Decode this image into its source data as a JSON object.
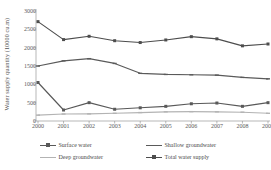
{
  "chart_data": {
    "type": "line",
    "title": "",
    "xlabel": "",
    "ylabel": "Water supply quantity (10000 cu.m)",
    "categories": [
      "2000",
      "2001",
      "2002",
      "2003",
      "2004",
      "2005",
      "2006",
      "2007",
      "2008",
      "2009"
    ],
    "ylim": [
      0,
      3000
    ],
    "yticks": [
      3000,
      2500,
      2000,
      1500,
      1000,
      500,
      0
    ],
    "ytick_labels": [
      "3000",
      "2500",
      "2000",
      "1500",
      "1000",
      "500",
      "0"
    ],
    "grid": false,
    "legend_position": "bottom",
    "series": [
      {
        "name": "Surface water",
        "color": "#595959",
        "marker": "square",
        "values": [
          1050,
          300,
          500,
          320,
          360,
          400,
          470,
          490,
          400,
          500
        ]
      },
      {
        "name": "Shallow groundwater",
        "color": "#5a5a5a",
        "marker": "dash",
        "values": [
          1500,
          1640,
          1700,
          1570,
          1300,
          1270,
          1260,
          1250,
          1190,
          1150
        ]
      },
      {
        "name": "Deep groundwater",
        "color": "#b3b3b3",
        "marker": "dash",
        "values": [
          160,
          190,
          195,
          210,
          230,
          250,
          255,
          250,
          240,
          210
        ]
      },
      {
        "name": "Total water supply",
        "color": "#4d4d4d",
        "marker": "square",
        "values": [
          2710,
          2220,
          2310,
          2190,
          2140,
          2210,
          2300,
          2240,
          2050,
          2100
        ]
      }
    ]
  },
  "legend": {
    "items": [
      {
        "label": "Surface water",
        "color": "#595959",
        "marker": "square"
      },
      {
        "label": "Shallow groundwater",
        "color": "#5a5a5a",
        "marker": "dash"
      },
      {
        "label": "Deep groundwater",
        "color": "#b3b3b3",
        "marker": "dash"
      },
      {
        "label": "Total water supply",
        "color": "#4d4d4d",
        "marker": "square"
      }
    ]
  },
  "axes": {
    "y_title": "Water supply quantity (10000 cu.m)",
    "axis_color": "#9a9a9a"
  }
}
